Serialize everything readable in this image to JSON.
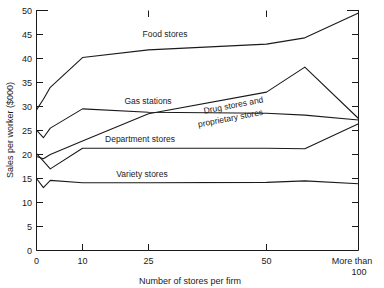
{
  "chart_data": {
    "type": "line",
    "title": "",
    "xlabel": "Number of stores per firm",
    "ylabel": "Sales per worker ($000)",
    "xtick_labels": [
      "0",
      "10",
      "25",
      "50",
      "More than",
      "100"
    ],
    "xtick_values": [
      0,
      10,
      25,
      50,
      110
    ],
    "ytick_labels": [
      "0",
      "5",
      "10",
      "15",
      "20",
      "25",
      "30",
      "35",
      "40",
      "45",
      "50"
    ],
    "ylim": [
      0,
      50
    ],
    "xlim": [
      0,
      110
    ],
    "grid": false,
    "legend": "inline-annotations",
    "x": [
      0,
      1.5,
      3,
      10,
      25,
      50,
      75,
      110
    ],
    "series": [
      {
        "name": "Food stores",
        "label": "Food stores",
        "values": [
          29.3,
          31.5,
          34.0,
          40.2,
          41.8,
          43.0,
          44.3,
          49.5
        ]
      },
      {
        "name": "Gas stations",
        "label": "Gas stations",
        "values": [
          25.1,
          23.5,
          25.5,
          29.5,
          28.8,
          28.6,
          28.2,
          27.2
        ]
      },
      {
        "name": "Drug stores and proprietary stores",
        "label": "Drug stores and proprietary stores",
        "values": [
          19.6,
          19.1,
          20.0,
          22.8,
          28.5,
          33.0,
          38.2,
          27.5
        ]
      },
      {
        "name": "Department stores",
        "label": "Department stores",
        "values": [
          20.2,
          18.6,
          17.0,
          21.3,
          21.3,
          21.3,
          21.2,
          26.4
        ]
      },
      {
        "name": "Variety stores",
        "label": "Variety stores",
        "values": [
          15.0,
          13.1,
          14.6,
          14.1,
          14.1,
          14.2,
          14.5,
          13.9
        ]
      }
    ],
    "annotations": [
      {
        "name": "food-stores",
        "text": "Food stores",
        "x": 165,
        "y": 37,
        "rotate": 0
      },
      {
        "name": "gas-stations",
        "text": "Gas stations",
        "x": 148,
        "y": 104,
        "rotate": 0
      },
      {
        "name": "drug-stores-line1",
        "text": "Drug stores and",
        "x": 234,
        "y": 108,
        "rotate": -11
      },
      {
        "name": "drug-stores-line2",
        "text": "proprietary stores",
        "x": 231,
        "y": 121,
        "rotate": -11
      },
      {
        "name": "department-stores",
        "text": "Department stores",
        "x": 140,
        "y": 142,
        "rotate": 0
      },
      {
        "name": "variety-stores",
        "text": "Variety stores",
        "x": 142,
        "y": 177,
        "rotate": 0
      }
    ]
  }
}
